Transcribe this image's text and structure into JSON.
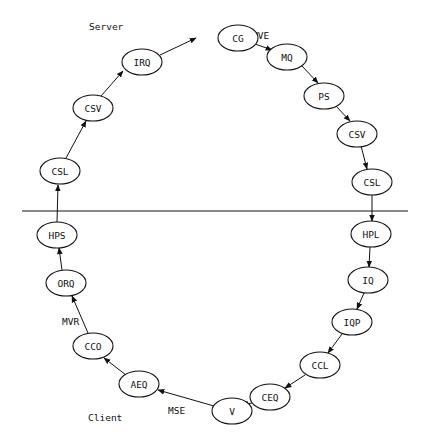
{
  "labels": {
    "server": "Server",
    "client": "Client",
    "edge_mve": "MVE",
    "edge_mvr": "MVR",
    "edge_mse": "MSE"
  },
  "nodes": [
    {
      "id": "cg",
      "label": "CG",
      "x": 238,
      "y": 38
    },
    {
      "id": "mq",
      "label": "MQ",
      "x": 287,
      "y": 57
    },
    {
      "id": "ps",
      "label": "PS",
      "x": 324,
      "y": 96
    },
    {
      "id": "csv_r",
      "label": "CSV",
      "x": 357,
      "y": 134
    },
    {
      "id": "csl_r",
      "label": "CSL",
      "x": 372,
      "y": 182
    },
    {
      "id": "hpl",
      "label": "HPL",
      "x": 371,
      "y": 234
    },
    {
      "id": "iq",
      "label": "IQ",
      "x": 368,
      "y": 280
    },
    {
      "id": "iqp",
      "label": "IQP",
      "x": 352,
      "y": 322
    },
    {
      "id": "ccl",
      "label": "CCL",
      "x": 320,
      "y": 365
    },
    {
      "id": "ceq",
      "label": "CEQ",
      "x": 270,
      "y": 397
    },
    {
      "id": "v",
      "label": "V",
      "x": 232,
      "y": 411
    },
    {
      "id": "aeq",
      "label": "AEQ",
      "x": 139,
      "y": 384
    },
    {
      "id": "cco",
      "label": "CCO",
      "x": 93,
      "y": 346
    },
    {
      "id": "orq",
      "label": "ORQ",
      "x": 66,
      "y": 283
    },
    {
      "id": "hps",
      "label": "HPS",
      "x": 57,
      "y": 235
    },
    {
      "id": "csl_l",
      "label": "CSL",
      "x": 60,
      "y": 171
    },
    {
      "id": "csv_l",
      "label": "CSV",
      "x": 93,
      "y": 108
    },
    {
      "id": "irq",
      "label": "IRQ",
      "x": 142,
      "y": 62
    }
  ],
  "divider_y": 211
}
